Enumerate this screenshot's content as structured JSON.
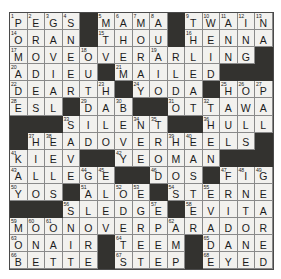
{
  "puzzle": {
    "title": "Crossword Grid",
    "rows": 15,
    "cols": 15,
    "colors": {
      "block": "#33322f",
      "cell": "#f2f1ee",
      "grid_line": "#8a8a8a",
      "text": "#1b1b1b",
      "background": "#ffffff"
    },
    "grid": [
      [
        {
          "n": "1",
          "l": "P"
        },
        {
          "n": "2",
          "l": "E"
        },
        {
          "n": "3",
          "l": "G"
        },
        {
          "n": "4",
          "l": "S"
        },
        {
          "b": true
        },
        {
          "n": "5",
          "l": "M"
        },
        {
          "n": "6",
          "l": "A"
        },
        {
          "n": "7",
          "l": "M"
        },
        {
          "n": "8",
          "l": "A"
        },
        {
          "b": true
        },
        {
          "n": "9",
          "l": "T"
        },
        {
          "n": "10",
          "l": "W"
        },
        {
          "n": "11",
          "l": "A"
        },
        {
          "n": "12",
          "l": "I"
        },
        {
          "n": "13",
          "l": "N"
        }
      ],
      [
        {
          "n": "14",
          "l": "O"
        },
        {
          "l": "R"
        },
        {
          "l": "A"
        },
        {
          "l": "N"
        },
        {
          "b": true
        },
        {
          "n": "15",
          "l": "T"
        },
        {
          "l": "H"
        },
        {
          "l": "O"
        },
        {
          "l": "U"
        },
        {
          "b": true
        },
        {
          "n": "16",
          "l": "H"
        },
        {
          "l": "E"
        },
        {
          "l": "N"
        },
        {
          "l": "N"
        },
        {
          "l": "A"
        }
      ],
      [
        {
          "n": "17",
          "l": "M"
        },
        {
          "l": "O"
        },
        {
          "l": "V"
        },
        {
          "l": "E"
        },
        {
          "n": "18",
          "l": "O"
        },
        {
          "l": "V"
        },
        {
          "l": "E"
        },
        {
          "l": "R"
        },
        {
          "n": "19",
          "l": "A"
        },
        {
          "l": "R"
        },
        {
          "l": "L"
        },
        {
          "l": "I"
        },
        {
          "l": "N"
        },
        {
          "l": "G"
        },
        {
          "b": true
        }
      ],
      [
        {
          "n": "20",
          "l": "A"
        },
        {
          "l": "D"
        },
        {
          "l": "I"
        },
        {
          "l": "E"
        },
        {
          "l": "U"
        },
        {
          "b": true
        },
        {
          "n": "21",
          "l": "M"
        },
        {
          "l": "A"
        },
        {
          "l": "I"
        },
        {
          "l": "L"
        },
        {
          "l": "E"
        },
        {
          "l": "D"
        },
        {
          "b": true
        },
        {
          "b": true
        },
        {
          "b": true
        }
      ],
      [
        {
          "n": "22",
          "l": "D"
        },
        {
          "l": "E"
        },
        {
          "l": "A"
        },
        {
          "l": "R"
        },
        {
          "l": "T"
        },
        {
          "n": "23",
          "l": "H"
        },
        {
          "b": true
        },
        {
          "n": "24",
          "l": "Y"
        },
        {
          "l": "O"
        },
        {
          "l": "D"
        },
        {
          "l": "A"
        },
        {
          "b": true
        },
        {
          "n": "25",
          "l": "H"
        },
        {
          "n": "26",
          "l": "O"
        },
        {
          "n": "27",
          "l": "P"
        }
      ],
      [
        {
          "n": "28",
          "l": "E"
        },
        {
          "l": "S"
        },
        {
          "l": "L"
        },
        {
          "b": true
        },
        {
          "n": "29",
          "l": "D"
        },
        {
          "l": "A"
        },
        {
          "n": "30",
          "l": "B"
        },
        {
          "b": true
        },
        {
          "b": true
        },
        {
          "n": "31",
          "l": "O"
        },
        {
          "l": "T"
        },
        {
          "n": "32",
          "l": "T"
        },
        {
          "l": "A"
        },
        {
          "l": "W"
        },
        {
          "l": "A"
        }
      ],
      [
        {
          "b": true
        },
        {
          "b": true
        },
        {
          "b": true
        },
        {
          "n": "33",
          "l": "S"
        },
        {
          "l": "I"
        },
        {
          "l": "L"
        },
        {
          "l": "E"
        },
        {
          "n": "34",
          "l": "N"
        },
        {
          "n": "35",
          "l": "T"
        },
        {
          "b": true
        },
        {
          "b": true
        },
        {
          "n": "36",
          "l": "H"
        },
        {
          "l": "U"
        },
        {
          "l": "L"
        },
        {
          "l": "L"
        }
      ],
      [
        {
          "b": true
        },
        {
          "n": "37",
          "l": "H"
        },
        {
          "n": "38",
          "l": "E"
        },
        {
          "l": "A"
        },
        {
          "l": "D"
        },
        {
          "l": "O"
        },
        {
          "l": "V"
        },
        {
          "l": "E"
        },
        {
          "l": "R"
        },
        {
          "n": "39",
          "l": "H"
        },
        {
          "n": "40",
          "l": "E"
        },
        {
          "l": "E"
        },
        {
          "l": "L"
        },
        {
          "l": "S"
        },
        {
          "b": true
        }
      ],
      [
        {
          "n": "41",
          "l": "K"
        },
        {
          "l": "I"
        },
        {
          "l": "E"
        },
        {
          "l": "V"
        },
        {
          "b": true
        },
        {
          "b": true
        },
        {
          "n": "42",
          "l": "Y"
        },
        {
          "l": "E"
        },
        {
          "l": "O"
        },
        {
          "l": "M"
        },
        {
          "l": "A"
        },
        {
          "l": "N"
        },
        {
          "b": true
        },
        {
          "b": true
        },
        {
          "b": true
        }
      ],
      [
        {
          "n": "43",
          "l": "A"
        },
        {
          "l": "L"
        },
        {
          "l": "L"
        },
        {
          "l": "E"
        },
        {
          "n": "44",
          "l": "G"
        },
        {
          "n": "45",
          "l": "E"
        },
        {
          "b": true
        },
        {
          "b": true
        },
        {
          "n": "46",
          "l": "D"
        },
        {
          "l": "O"
        },
        {
          "l": "S"
        },
        {
          "b": true
        },
        {
          "n": "47",
          "l": "F"
        },
        {
          "n": "48",
          "l": "I"
        },
        {
          "n": "49",
          "l": "G"
        }
      ],
      [
        {
          "n": "50",
          "l": "Y"
        },
        {
          "l": "O"
        },
        {
          "l": "S"
        },
        {
          "b": true
        },
        {
          "n": "51",
          "l": "A"
        },
        {
          "l": "L"
        },
        {
          "n": "52",
          "l": "O"
        },
        {
          "n": "53",
          "l": "E"
        },
        {
          "b": true
        },
        {
          "n": "54",
          "l": "S"
        },
        {
          "l": "T"
        },
        {
          "n": "55",
          "l": "E"
        },
        {
          "l": "R"
        },
        {
          "l": "N"
        },
        {
          "l": "E"
        }
      ],
      [
        {
          "b": true
        },
        {
          "b": true
        },
        {
          "b": true
        },
        {
          "n": "56",
          "l": "S"
        },
        {
          "l": "L"
        },
        {
          "l": "E"
        },
        {
          "l": "D"
        },
        {
          "l": "G"
        },
        {
          "n": "57",
          "l": "E"
        },
        {
          "b": true
        },
        {
          "n": "58",
          "l": "E"
        },
        {
          "l": "V"
        },
        {
          "l": "I"
        },
        {
          "l": "T"
        },
        {
          "l": "A"
        }
      ],
      [
        {
          "n": "59",
          "l": "M"
        },
        {
          "n": "60",
          "l": "O"
        },
        {
          "n": "61",
          "l": "O"
        },
        {
          "l": "N"
        },
        {
          "l": "O"
        },
        {
          "l": "V"
        },
        {
          "l": "E"
        },
        {
          "l": "R"
        },
        {
          "l": "P"
        },
        {
          "n": "62",
          "l": "A"
        },
        {
          "l": "R"
        },
        {
          "l": "A"
        },
        {
          "l": "D"
        },
        {
          "l": "O"
        },
        {
          "l": "R"
        }
      ],
      [
        {
          "n": "63",
          "l": "O"
        },
        {
          "l": "N"
        },
        {
          "l": "A"
        },
        {
          "l": "I"
        },
        {
          "l": "R"
        },
        {
          "b": true
        },
        {
          "n": "64",
          "l": "T"
        },
        {
          "l": "E"
        },
        {
          "l": "E"
        },
        {
          "l": "M"
        },
        {
          "b": true
        },
        {
          "n": "65",
          "l": "D"
        },
        {
          "l": "A"
        },
        {
          "l": "N"
        },
        {
          "l": "E"
        }
      ],
      [
        {
          "n": "66",
          "l": "B"
        },
        {
          "l": "E"
        },
        {
          "l": "T"
        },
        {
          "l": "T"
        },
        {
          "l": "E"
        },
        {
          "b": true
        },
        {
          "n": "67",
          "l": "S"
        },
        {
          "l": "T"
        },
        {
          "l": "E"
        },
        {
          "l": "P"
        },
        {
          "b": true
        },
        {
          "n": "68",
          "l": "E"
        },
        {
          "l": "Y"
        },
        {
          "l": "E"
        },
        {
          "l": "D"
        }
      ]
    ]
  }
}
